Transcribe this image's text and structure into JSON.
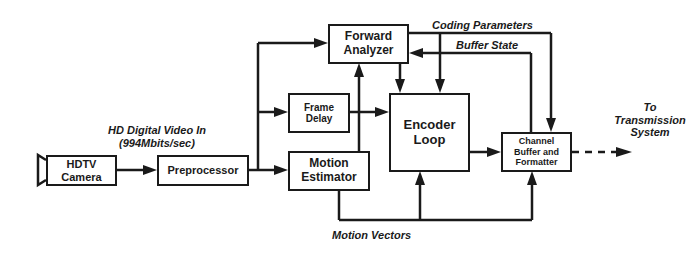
{
  "diagram": {
    "blocks": {
      "camera": {
        "label_line1": "HDTV",
        "label_line2": "Camera"
      },
      "preprocessor": {
        "label": "Preprocessor"
      },
      "forward_analyzer": {
        "label_line1": "Forward",
        "label_line2": "Analyzer"
      },
      "frame_delay": {
        "label_line1": "Frame",
        "label_line2": "Delay"
      },
      "motion_estimator": {
        "label_line1": "Motion",
        "label_line2": "Estimator"
      },
      "encoder_loop": {
        "label_line1": "Encoder",
        "label_line2": "Loop"
      },
      "channel_buffer": {
        "label_line1": "Channel",
        "label_line2": "Buffer and",
        "label_line3": "Formatter"
      }
    },
    "labels": {
      "input_line1": "HD Digital Video In",
      "input_line2": "(994Mbits/sec)",
      "coding_parameters": "Coding Parameters",
      "buffer_state": "Buffer State",
      "motion_vectors": "Motion Vectors",
      "output_line1": "To",
      "output_line2": "Transmission",
      "output_line3": "System"
    },
    "colors": {
      "stroke": "#1a1a1a",
      "background": "#ffffff"
    }
  }
}
